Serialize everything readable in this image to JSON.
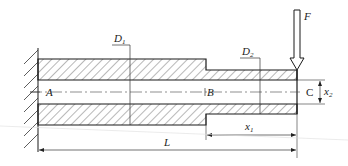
{
  "diagram": {
    "type": "stepped hollow cantilever shaft",
    "support": "fixed wall (left)",
    "points": [
      {
        "id": "A",
        "label": "A"
      },
      {
        "id": "B",
        "label": "B"
      },
      {
        "id": "C",
        "label": "C"
      }
    ],
    "load": {
      "label": "F",
      "direction": "down",
      "location": "free end"
    },
    "dimensions": {
      "D1": {
        "main": "D",
        "sub": "1"
      },
      "D2": {
        "main": "D",
        "sub": "2"
      },
      "x1": {
        "main": "x",
        "sub": "1"
      },
      "x2": {
        "main": "x",
        "sub": "2"
      },
      "L": {
        "main": "L"
      }
    },
    "colors": {
      "line": "#1a1a1a",
      "hatch": "#333333",
      "background": "#ffffff"
    }
  }
}
